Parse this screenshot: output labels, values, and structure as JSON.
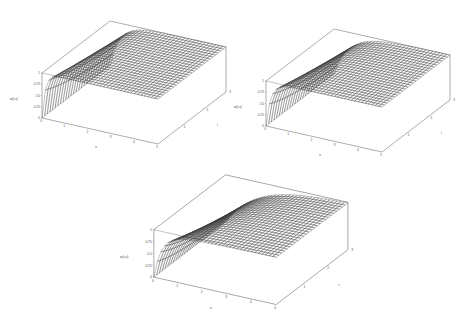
{
  "figure": {
    "background": "#ffffff",
    "ink": "#333333",
    "layout": "three 3d surface mesh plots: two on top row, one centered below",
    "plot_count": 3
  },
  "plots": [
    {
      "id": "plot-top-left",
      "zlabel": "w(t,x)",
      "xlabel": "x",
      "ylabel": "t",
      "z_ticks": [
        "1",
        "0.75",
        "0.5",
        "0.25",
        "0"
      ],
      "x_ticks": [
        "0",
        "1",
        "2",
        "3",
        "4",
        "5"
      ],
      "y_ticks": [
        "0",
        "1",
        "2",
        "3"
      ],
      "chart_data": {
        "type": "surface",
        "title": "",
        "xlabel": "x",
        "ylabel": "t",
        "zlabel": "w(t,x)",
        "xlim": [
          0,
          5
        ],
        "ylim": [
          0,
          3
        ],
        "zlim": [
          0,
          1
        ],
        "grid": true,
        "mesh_nx": 34,
        "mesh_ny": 26,
        "description": "Surface near w=1 over most of the domain, dropping sharply toward 0 along the near-left edge (small x)."
      }
    },
    {
      "id": "plot-top-right",
      "zlabel": "w(t,x)",
      "xlabel": "x",
      "ylabel": "t",
      "z_ticks": [
        "1",
        "0.75",
        "0.5",
        "0.25",
        "0"
      ],
      "x_ticks": [
        "0",
        "1",
        "2",
        "3",
        "4",
        "5"
      ],
      "y_ticks": [
        "0",
        "1",
        "2",
        "3"
      ],
      "chart_data": {
        "type": "surface",
        "title": "",
        "xlabel": "x",
        "ylabel": "t",
        "zlabel": "w(t,x)",
        "xlim": [
          0,
          5
        ],
        "ylim": [
          0,
          3
        ],
        "zlim": [
          0,
          1
        ],
        "grid": true,
        "mesh_nx": 34,
        "mesh_ny": 26,
        "description": "Surface near w=1 over most of the domain with a steeper, more rounded boundary layer near the left edge."
      }
    },
    {
      "id": "plot-bottom-center",
      "zlabel": "w(t,x)",
      "xlabel": "x",
      "ylabel": "t",
      "z_ticks": [
        "1",
        "0.75",
        "0.5",
        "0.25",
        "0"
      ],
      "x_ticks": [
        "0",
        "1",
        "2",
        "3",
        "4",
        "5"
      ],
      "y_ticks": [
        "0",
        "1",
        "2",
        "3"
      ],
      "chart_data": {
        "type": "surface",
        "title": "",
        "xlabel": "x",
        "ylabel": "t",
        "zlabel": "w(t,x)",
        "xlim": [
          0,
          5
        ],
        "ylim": [
          0,
          3
        ],
        "zlim": [
          0,
          1
        ],
        "grid": true,
        "mesh_nx": 34,
        "mesh_ny": 26,
        "description": "Surface near w=1 over most of the domain with a broad curved transition region descending to 0 near the left edge."
      }
    }
  ]
}
